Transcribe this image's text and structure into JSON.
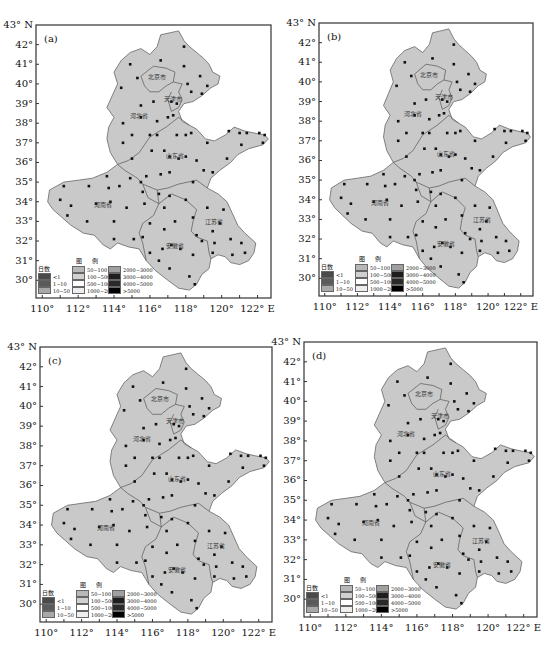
{
  "figure": {
    "panels": [
      {
        "id": "a",
        "label": "(a)"
      },
      {
        "id": "b",
        "label": "(b)"
      },
      {
        "id": "c",
        "label": "(c)"
      },
      {
        "id": "d",
        "label": "(d)"
      }
    ],
    "y_ticks": [
      "43° N",
      "42°",
      "41°",
      "40°",
      "39°",
      "38°",
      "37°",
      "36°",
      "35°",
      "34°",
      "33°",
      "32°",
      "31°",
      "30°"
    ],
    "x_ticks": [
      "110°",
      "112°",
      "114°",
      "116°",
      "118°",
      "120°",
      "122° E"
    ],
    "region_labels": [
      "北京市",
      "天津市",
      "河北省",
      "山东省",
      "河南省",
      "安徽省",
      "江苏省"
    ],
    "legend": {
      "title": "图 例",
      "unit_label": "日数",
      "items": [
        {
          "label": "<1",
          "color": "#4a4a4a"
        },
        {
          "label": "1~10",
          "color": "#5a5a5a"
        },
        {
          "label": "10~50",
          "color": "#a8a8a8"
        },
        {
          "label": "50~100",
          "color": "#b8b8b8"
        },
        {
          "label": "100~500",
          "color": "#d0d0d0"
        },
        {
          "label": "500~1000",
          "color": "#ffffff"
        },
        {
          "label": "1000~2000",
          "color": "#eeeeee"
        },
        {
          "label": "2000~3000",
          "color": "#a0a0a0"
        },
        {
          "label": "3000~4000",
          "color": "#1e1e1e"
        },
        {
          "label": "4000~5000",
          "color": "#2a2a2a"
        },
        {
          "label": ">5000",
          "color": "#000000"
        }
      ]
    },
    "colors": {
      "land_fill": "#c9c9c9",
      "border": "#555555",
      "station": "#111111",
      "frame": "#333333"
    }
  }
}
